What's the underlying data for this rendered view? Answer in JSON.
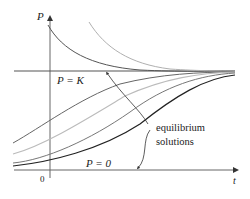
{
  "figure": {
    "type": "logistic-solution-curves",
    "axes": {
      "y_label": "P",
      "x_label": "t",
      "origin_label": "0"
    },
    "equilibria": {
      "upper_label": "P = K",
      "lower_label": "P = 0",
      "annotation_line1": "equilibrium",
      "annotation_line2": "solutions"
    },
    "curves": {
      "above_K": [
        {
          "name": "decay-from-high-dark",
          "shade": "#555555"
        },
        {
          "name": "decay-from-high-light",
          "shade": "#b0b0b0"
        }
      ],
      "between_0_and_K": [
        {
          "name": "growth-1",
          "shade": "#666666"
        },
        {
          "name": "growth-2",
          "shade": "#bdbdbd"
        },
        {
          "name": "growth-3",
          "shade": "#777777"
        },
        {
          "name": "growth-4",
          "shade": "#222222"
        }
      ]
    },
    "colors": {
      "axis": "#555555",
      "equilibrium": "#555555",
      "text": "#222222"
    }
  }
}
